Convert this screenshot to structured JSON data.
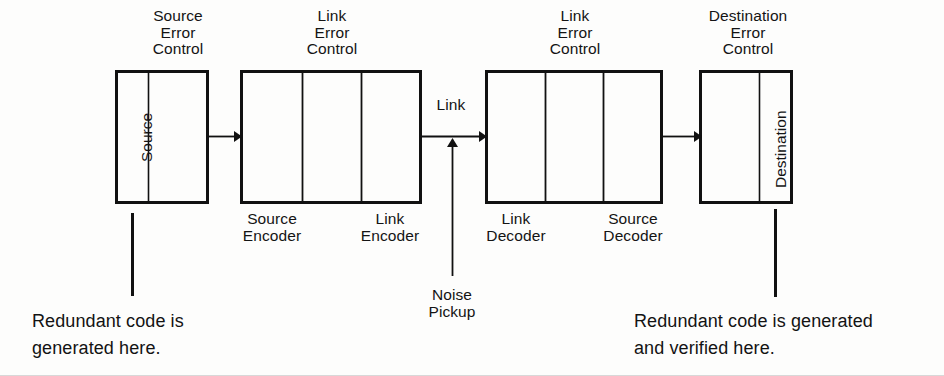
{
  "diagram": {
    "title_blocks": {
      "source_error_control": [
        "Source",
        "Error",
        "Control"
      ],
      "link_error_control_encode": [
        "Link",
        "Error",
        "Control"
      ],
      "link_error_control_decode": [
        "Link",
        "Error",
        "Control"
      ],
      "destination_error_control": [
        "Destination",
        "Error",
        "Control"
      ]
    },
    "boxes": [
      {
        "id": "source-box",
        "vertical_label": "Source"
      },
      {
        "id": "encoder-box",
        "segments": [
          "Source Encoder",
          "Link Encoder"
        ]
      },
      {
        "id": "decoder-box",
        "segments": [
          "Link Decoder",
          "Source Decoder"
        ]
      },
      {
        "id": "destination-box",
        "vertical_label": "Destination"
      }
    ],
    "bottom_labels": {
      "source_encoder": [
        "Source",
        "Encoder"
      ],
      "link_encoder": [
        "Link",
        "Encoder"
      ],
      "link_decoder": [
        "Link",
        "Decoder"
      ],
      "source_decoder": [
        "Source",
        "Decoder"
      ]
    },
    "link_label": "Link",
    "noise_label": [
      "Noise",
      "Pickup"
    ],
    "captions": {
      "left": [
        "Redundant code is",
        "generated here."
      ],
      "right": [
        "Redundant code is generated",
        "and verified here."
      ]
    },
    "colors": {
      "line": "#111111",
      "text": "#141414",
      "background": "#fdfdfc"
    }
  }
}
